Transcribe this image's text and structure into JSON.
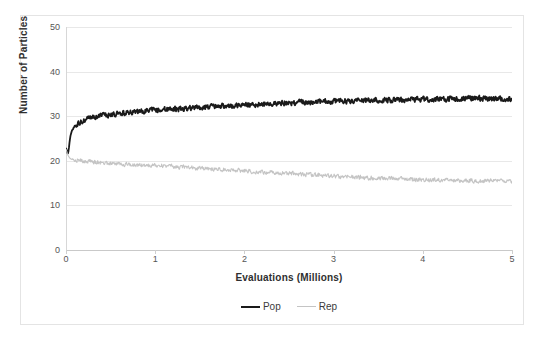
{
  "chart_data": {
    "type": "line",
    "title": "",
    "xlabel": "Evaluations (Millions)",
    "ylabel": "Number of Particles",
    "xlim": [
      0,
      5
    ],
    "ylim": [
      0,
      50
    ],
    "xticks": [
      "0",
      "1",
      "2",
      "3",
      "4",
      "5"
    ],
    "yticks": [
      "0",
      "10",
      "20",
      "30",
      "40",
      "50"
    ],
    "grid": "horizontal",
    "legend_position": "bottom",
    "series": [
      {
        "name": "Pop",
        "color": "#1a1a1a",
        "width": 1.8,
        "x": [
          0,
          0.01,
          0.02,
          0.03,
          0.04,
          0.05,
          0.06,
          0.07,
          0.08,
          0.09,
          0.1,
          0.12,
          0.14,
          0.16,
          0.18,
          0.2,
          0.25,
          0.3,
          0.35,
          0.4,
          0.45,
          0.5,
          0.6,
          0.7,
          0.8,
          0.9,
          1.0,
          1.1,
          1.2,
          1.3,
          1.4,
          1.5,
          1.6,
          1.7,
          1.8,
          1.9,
          2.0,
          2.1,
          2.2,
          2.3,
          2.4,
          2.5,
          2.6,
          2.7,
          2.8,
          2.9,
          3.0,
          3.1,
          3.2,
          3.3,
          3.4,
          3.5,
          3.6,
          3.7,
          3.8,
          3.9,
          4.0,
          4.1,
          4.2,
          4.3,
          4.4,
          4.5,
          4.6,
          4.7,
          4.8,
          4.9,
          5.0
        ],
        "y": [
          22.8,
          22.2,
          21.5,
          22.4,
          24.2,
          25.6,
          26.4,
          26.9,
          27.2,
          27.5,
          27.8,
          28.1,
          28.3,
          28.5,
          28.8,
          29.0,
          29.4,
          29.7,
          29.9,
          30.1,
          30.2,
          30.4,
          30.6,
          30.8,
          31.0,
          31.2,
          31.4,
          31.5,
          31.6,
          31.7,
          31.8,
          32.0,
          32.1,
          32.2,
          32.3,
          32.4,
          32.5,
          32.6,
          32.7,
          32.8,
          32.9,
          33.0,
          33.1,
          33.1,
          33.2,
          33.3,
          33.3,
          33.4,
          33.4,
          33.5,
          33.5,
          33.6,
          33.6,
          33.7,
          33.7,
          33.8,
          33.8,
          33.8,
          33.9,
          33.9,
          33.9,
          34.0,
          34.0,
          34.0,
          33.9,
          33.9,
          33.8
        ],
        "noise": 0.55,
        "start_value": 22.8,
        "end_value": 33.8,
        "plateau_value": 33.5
      },
      {
        "name": "Rep",
        "color": "#c4c4c4",
        "width": 1.1,
        "x": [
          0,
          0.01,
          0.02,
          0.03,
          0.04,
          0.05,
          0.06,
          0.07,
          0.08,
          0.09,
          0.1,
          0.12,
          0.14,
          0.16,
          0.18,
          0.2,
          0.25,
          0.3,
          0.35,
          0.4,
          0.45,
          0.5,
          0.6,
          0.7,
          0.8,
          0.9,
          1.0,
          1.1,
          1.2,
          1.3,
          1.4,
          1.5,
          1.6,
          1.7,
          1.8,
          1.9,
          2.0,
          2.1,
          2.2,
          2.3,
          2.4,
          2.5,
          2.6,
          2.7,
          2.8,
          2.9,
          3.0,
          3.1,
          3.2,
          3.3,
          3.4,
          3.5,
          3.6,
          3.7,
          3.8,
          3.9,
          4.0,
          4.1,
          4.2,
          4.3,
          4.4,
          4.5,
          4.6,
          4.7,
          4.8,
          4.9,
          5.0
        ],
        "y": [
          22.6,
          22.0,
          21.3,
          21.0,
          20.7,
          20.5,
          20.4,
          20.3,
          20.3,
          20.2,
          20.2,
          20.1,
          20.1,
          20.0,
          20.0,
          20.0,
          19.9,
          19.8,
          19.7,
          19.6,
          19.5,
          19.4,
          19.3,
          19.2,
          19.1,
          19.0,
          18.9,
          18.8,
          18.7,
          18.6,
          18.5,
          18.3,
          18.2,
          18.1,
          18.0,
          17.9,
          17.8,
          17.6,
          17.5,
          17.4,
          17.3,
          17.2,
          17.0,
          16.9,
          16.8,
          16.7,
          16.6,
          16.5,
          16.4,
          16.3,
          16.2,
          16.1,
          16.0,
          16.0,
          15.9,
          15.8,
          15.8,
          15.7,
          15.7,
          15.6,
          15.6,
          15.6,
          15.5,
          15.5,
          15.5,
          15.5,
          15.5
        ],
        "noise": 0.45,
        "start_value": 22.6,
        "end_value": 15.5,
        "plateau_value": 15.6
      }
    ]
  },
  "axes": {
    "y_title": "Number of Particles",
    "x_title": "Evaluations (Millions)",
    "y_labels": [
      "50",
      "40",
      "30",
      "20",
      "10",
      "0"
    ],
    "x_labels": [
      "0",
      "1",
      "2",
      "3",
      "4",
      "5"
    ]
  },
  "legend": {
    "items": [
      {
        "label": "Pop",
        "color": "#1a1a1a",
        "thickness": "2px"
      },
      {
        "label": "Rep",
        "color": "#c4c4c4",
        "thickness": "1px"
      }
    ]
  },
  "colors": {
    "pop": "#1a1a1a",
    "rep": "#c4c4c4",
    "gridline": "#e8e8e8",
    "frame": "#e4e4e4",
    "axis": "#c9c9c9",
    "text": "#3b3b3b"
  }
}
